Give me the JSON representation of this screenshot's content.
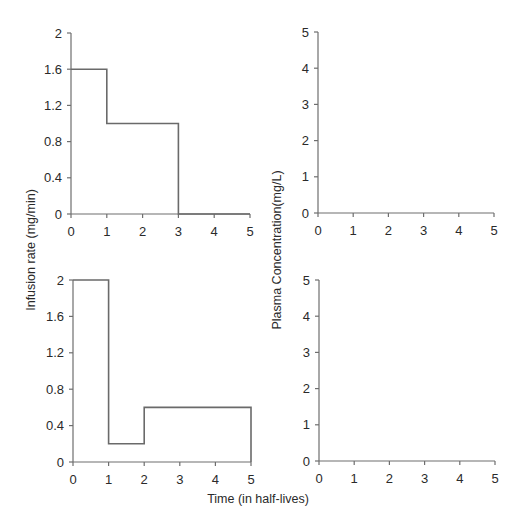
{
  "labels": {
    "y_left": "Infusion rate (mg/min)",
    "y_right": "Plasma Concentration(mg/L)",
    "x_shared": "Time (in half-lives)"
  },
  "colors": {
    "axis": "#6e6e6e",
    "series": "#6a6a6a",
    "background": "#ffffff"
  },
  "chart_data": [
    {
      "id": "top-left",
      "type": "line",
      "step": true,
      "title": "",
      "xlabel": "",
      "ylabel": "Infusion rate (mg/min)",
      "xlim": [
        0,
        5
      ],
      "ylim": [
        0,
        2
      ],
      "xticks": [
        0,
        1,
        2,
        3,
        4,
        5
      ],
      "yticks": [
        0,
        0.4,
        0.8,
        1.2,
        1.6,
        2
      ],
      "ytick_labels": [
        "0",
        "0.4",
        "0.8",
        "1.2",
        "1.6",
        "2"
      ],
      "grid": false,
      "series": [
        {
          "name": "infusion rate",
          "segments": [
            {
              "x0": 0,
              "x1": 1,
              "y": 1.6
            },
            {
              "x0": 1,
              "x1": 3,
              "y": 1.0
            },
            {
              "x0": 3,
              "x1": 5,
              "y": 0
            }
          ]
        }
      ],
      "box": {
        "left": 71,
        "right": 250,
        "top": 33,
        "bottom": 214
      }
    },
    {
      "id": "top-right",
      "type": "line",
      "title": "",
      "xlabel": "",
      "ylabel": "Plasma Concentration(mg/L)",
      "xlim": [
        0,
        5
      ],
      "ylim": [
        0,
        5
      ],
      "xticks": [
        0,
        1,
        2,
        3,
        4,
        5
      ],
      "yticks": [
        0,
        1,
        2,
        3,
        4,
        5
      ],
      "ytick_labels": [
        "0",
        "1",
        "2",
        "3",
        "4",
        "5"
      ],
      "grid": false,
      "series": [],
      "box": {
        "left": 318,
        "right": 494,
        "top": 32,
        "bottom": 213
      }
    },
    {
      "id": "bottom-left",
      "type": "line",
      "step": true,
      "title": "",
      "xlabel": "Time (in half-lives)",
      "ylabel": "Infusion rate (mg/min)",
      "xlim": [
        0,
        5
      ],
      "ylim": [
        0,
        2
      ],
      "xticks": [
        0,
        1,
        2,
        3,
        4,
        5
      ],
      "yticks": [
        0,
        0.4,
        0.8,
        1.2,
        1.6,
        2
      ],
      "ytick_labels": [
        "0",
        "0.4",
        "0.8",
        "1.2",
        "1.6",
        "2"
      ],
      "grid": false,
      "series": [
        {
          "name": "infusion rate",
          "segments": [
            {
              "x0": 0,
              "x1": 1,
              "y": 2.0
            },
            {
              "x0": 1,
              "x1": 2,
              "y": 0.2
            },
            {
              "x0": 2,
              "x1": 5,
              "y": 0.6
            }
          ]
        }
      ],
      "box": {
        "left": 73,
        "right": 251,
        "top": 280,
        "bottom": 462
      }
    },
    {
      "id": "bottom-right",
      "type": "line",
      "title": "",
      "xlabel": "Time (in half-lives)",
      "ylabel": "Plasma Concentration(mg/L)",
      "xlim": [
        0,
        5
      ],
      "ylim": [
        0,
        5
      ],
      "xticks": [
        0,
        1,
        2,
        3,
        4,
        5
      ],
      "yticks": [
        0,
        1,
        2,
        3,
        4,
        5
      ],
      "ytick_labels": [
        "0",
        "1",
        "2",
        "3",
        "4",
        "5"
      ],
      "grid": false,
      "series": [],
      "box": {
        "left": 319,
        "right": 495,
        "top": 280,
        "bottom": 461
      }
    }
  ]
}
